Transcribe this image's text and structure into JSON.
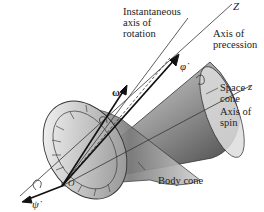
{
  "figure": {
    "type": "physics-diagram",
    "labels": {
      "instantaneous_axis": "Instantaneous\naxis of\nrotation",
      "axis_precession": "Axis of\nprecession",
      "space_cone": "Space\ncone",
      "axis_spin": "Axis of\nspin",
      "body_cone": "Body cone"
    },
    "symbols": {
      "Z": "Z",
      "z": "z",
      "omega": "ω",
      "phi_dot": "φ̇",
      "psi_dot": "ψ̇",
      "origin": "O"
    },
    "colors": {
      "line": "#333333",
      "cone_dark": "#555555",
      "cone_light": "#e8e8e8",
      "background": "#ffffff"
    }
  }
}
